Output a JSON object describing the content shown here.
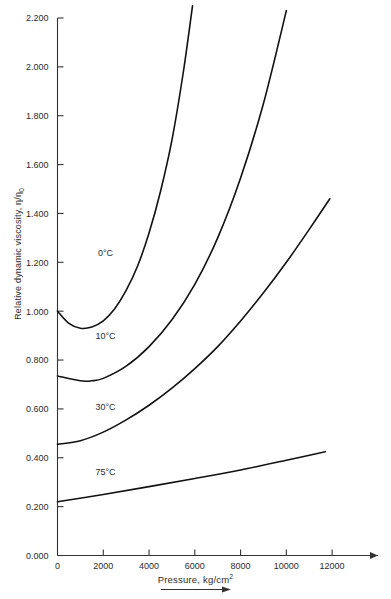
{
  "chart_data": {
    "type": "line",
    "title": "",
    "xlabel": "Pressure, kg/cm2",
    "ylabel": "Relative dynamic viscosity, n/n0",
    "xlim": [
      0,
      13000
    ],
    "ylim": [
      0.0,
      2.2
    ],
    "grid": false,
    "legend_position": "inline-curve-labels",
    "xticks": [
      0,
      2000,
      4000,
      6000,
      8000,
      10000,
      12000
    ],
    "xtick_labels": [
      "0",
      "2000",
      "4000",
      "6000",
      "8000",
      "10000",
      "12000"
    ],
    "yticks": [
      0.0,
      0.2,
      0.4,
      0.6,
      0.8,
      1.0,
      1.2,
      1.4,
      1.6,
      1.8,
      2.0,
      2.2
    ],
    "ytick_labels": [
      "0.000",
      "0.200",
      "0.400",
      "0.600",
      "0.800",
      "1.000",
      "1.200",
      "1.400",
      "1.600",
      "1.800",
      "2.000",
      "2.200"
    ],
    "series": [
      {
        "name": "0°C",
        "label": "0°C",
        "color": "#111111",
        "x": [
          0,
          500,
          1000,
          1500,
          2000,
          2500,
          3000,
          3500,
          4000,
          4500,
          5000,
          5500,
          5900
        ],
        "values": [
          1.0,
          0.95,
          0.93,
          0.935,
          0.96,
          1.01,
          1.085,
          1.185,
          1.32,
          1.49,
          1.7,
          1.98,
          2.25
        ]
      },
      {
        "name": "10°C",
        "label": "10°C",
        "color": "#111111",
        "x": [
          0,
          1000,
          1500,
          2000,
          3000,
          4000,
          5000,
          6000,
          7000,
          8000,
          9000,
          10000
        ],
        "values": [
          0.735,
          0.715,
          0.715,
          0.725,
          0.775,
          0.855,
          0.965,
          1.11,
          1.3,
          1.545,
          1.85,
          2.23
        ]
      },
      {
        "name": "30°C",
        "label": "30°C",
        "color": "#111111",
        "x": [
          0,
          1000,
          2000,
          3000,
          4000,
          5000,
          6000,
          7000,
          8000,
          9000,
          10000,
          11000,
          11900
        ],
        "values": [
          0.455,
          0.47,
          0.505,
          0.555,
          0.615,
          0.685,
          0.765,
          0.855,
          0.96,
          1.075,
          1.2,
          1.335,
          1.46
        ]
      },
      {
        "name": "75°C",
        "label": "75°C",
        "color": "#111111",
        "x": [
          0,
          2000,
          4000,
          6000,
          8000,
          10000,
          11700
        ],
        "values": [
          0.22,
          0.25,
          0.282,
          0.315,
          0.35,
          0.39,
          0.425
        ]
      }
    ],
    "curve_label_positions": [
      {
        "series": "0°C",
        "x": 2100,
        "y": 1.225
      },
      {
        "series": "10°C",
        "x": 2100,
        "y": 0.885
      },
      {
        "series": "30°C",
        "x": 2100,
        "y": 0.595
      },
      {
        "series": "75°C",
        "x": 2100,
        "y": 0.33
      }
    ]
  },
  "axes": {
    "ylabel_prefix": "Relative dynamic viscosity, ",
    "ylabel_symbol_num": "η",
    "ylabel_symbol_sep": "/",
    "ylabel_symbol_den": "η",
    "ylabel_symbol_sub": "0",
    "xlabel_text": "Pressure, kg/cm",
    "xlabel_sup": "2"
  },
  "colors": {
    "background": "#ffffff",
    "curve": "#111111",
    "axis": "#333333",
    "text": "#2b2b2b"
  }
}
